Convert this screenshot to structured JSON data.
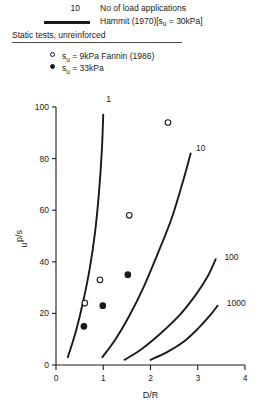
{
  "legend": {
    "count_value": "10",
    "count_label": "No of load applications",
    "line_label": "Hammit (1970)[s",
    "line_label_sub": "u",
    "line_label_tail": " = 30kPa]",
    "static_heading": "Static tests, unreinforced",
    "open_label": "s",
    "open_label_sub": "u",
    "open_label_tail": " = 9kPa Fannin (1986)",
    "filled_label": "s",
    "filled_label_sub": "u",
    "filled_label_tail": " = 33kPa"
  },
  "chart_data": {
    "type": "line",
    "title": "",
    "xlabel": "D/R",
    "ylabel": "p/s",
    "ylabel_sub": "u",
    "xlim": [
      0,
      4
    ],
    "ylim": [
      0,
      100
    ],
    "xticks": [
      "0",
      "1",
      "2",
      "3",
      "4"
    ],
    "xtick_values": [
      0,
      1,
      2,
      3,
      4
    ],
    "yticks": [
      "0",
      "20",
      "40",
      "60",
      "80",
      "100"
    ],
    "ytick_values": [
      0,
      20,
      40,
      60,
      80,
      100
    ],
    "grid": false,
    "legend_position": "above-plot",
    "series": [
      {
        "name": "1",
        "label": "1",
        "label_point": [
          1.0,
          103
        ],
        "points": [
          [
            0.25,
            3
          ],
          [
            0.42,
            13
          ],
          [
            0.58,
            25
          ],
          [
            0.72,
            38
          ],
          [
            0.83,
            52
          ],
          [
            0.91,
            67
          ],
          [
            0.97,
            83
          ],
          [
            1.0,
            97
          ]
        ]
      },
      {
        "name": "10",
        "label": "10",
        "label_point": [
          2.9,
          84
        ],
        "points": [
          [
            0.98,
            3
          ],
          [
            1.26,
            10
          ],
          [
            1.55,
            19
          ],
          [
            1.85,
            30
          ],
          [
            2.15,
            43
          ],
          [
            2.45,
            57
          ],
          [
            2.7,
            72
          ],
          [
            2.85,
            82
          ]
        ]
      },
      {
        "name": "100",
        "label": "100",
        "label_point": [
          3.5,
          42
        ],
        "points": [
          [
            1.45,
            2
          ],
          [
            1.8,
            6
          ],
          [
            2.2,
            12
          ],
          [
            2.6,
            19
          ],
          [
            2.95,
            27
          ],
          [
            3.2,
            34
          ],
          [
            3.38,
            41
          ]
        ]
      },
      {
        "name": "1000",
        "label": "1000",
        "label_point": [
          3.55,
          24
        ],
        "points": [
          [
            2.0,
            2
          ],
          [
            2.35,
            5
          ],
          [
            2.7,
            9
          ],
          [
            3.0,
            14
          ],
          [
            3.25,
            19
          ],
          [
            3.42,
            23
          ]
        ]
      }
    ],
    "scatter": [
      {
        "name": "su = 9kPa Fannin (1986)",
        "marker": "open-circle",
        "points": [
          [
            2.37,
            94
          ],
          [
            1.55,
            58
          ],
          [
            0.93,
            33
          ],
          [
            0.61,
            24
          ]
        ]
      },
      {
        "name": "su = 33kPa",
        "marker": "filled-circle",
        "points": [
          [
            1.52,
            35
          ],
          [
            0.99,
            23
          ],
          [
            0.59,
            15
          ]
        ]
      }
    ]
  }
}
